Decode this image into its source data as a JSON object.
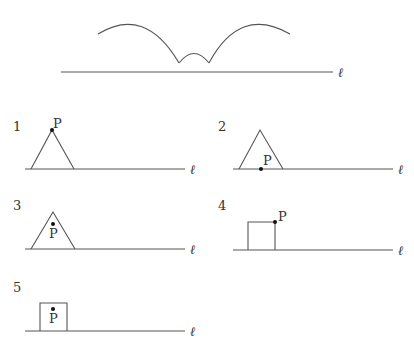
{
  "line_label": "ℓ",
  "point_label": "P",
  "top_figure": {
    "description": "Cycloid-like path of a point traced above line ℓ: two large arcs joined by a small arc"
  },
  "figures": [
    {
      "number": "1",
      "shape": "triangle",
      "point_position": "apex"
    },
    {
      "number": "2",
      "shape": "triangle",
      "point_position": "on base"
    },
    {
      "number": "3",
      "shape": "triangle",
      "point_position": "inside near apex"
    },
    {
      "number": "4",
      "shape": "square",
      "point_position": "top-right vertex"
    },
    {
      "number": "5",
      "shape": "square",
      "point_position": "inside near top"
    }
  ],
  "colors": {
    "line": "#555555",
    "text": "#333333",
    "point": "#111111"
  }
}
